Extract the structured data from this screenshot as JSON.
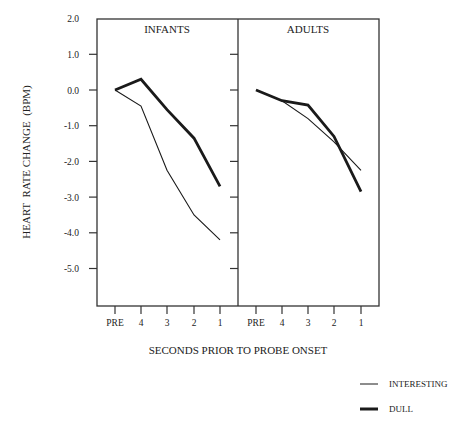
{
  "chart_data": [
    {
      "type": "line",
      "panel": "INFANTS",
      "title": "INFANTS",
      "categories": [
        "PRE",
        "4",
        "3",
        "2",
        "1"
      ],
      "series": [
        {
          "name": "INTERESTING",
          "values": [
            0.0,
            -0.45,
            -2.25,
            -3.5,
            -4.2
          ]
        },
        {
          "name": "DULL",
          "values": [
            0.0,
            0.3,
            -0.55,
            -1.35,
            -2.7
          ]
        }
      ],
      "xlabel": "SECONDS PRIOR TO PROBE ONSET",
      "ylabel": "HEART  RATE CHANGE  (BPM)",
      "ylim": [
        -6.0,
        2.0
      ],
      "yticks": [
        "2.0",
        "1.0",
        "0.0",
        "-1.0",
        "-2.0",
        "-3.0",
        "-4.0",
        "-5.0"
      ],
      "grid": false
    },
    {
      "type": "line",
      "panel": "ADULTS",
      "title": "ADULTS",
      "categories": [
        "PRE",
        "4",
        "3",
        "2",
        "1"
      ],
      "series": [
        {
          "name": "INTERESTING",
          "values": [
            0.0,
            -0.3,
            -0.8,
            -1.45,
            -2.25
          ]
        },
        {
          "name": "DULL",
          "values": [
            0.0,
            -0.3,
            -0.42,
            -1.3,
            -2.85
          ]
        }
      ],
      "xlabel": "SECONDS PRIOR TO PROBE ONSET",
      "ylabel": "HEART  RATE CHANGE  (BPM)",
      "ylim": [
        -6.0,
        2.0
      ],
      "grid": false
    }
  ],
  "labels": {
    "ylabel": "HEART  RATE CHANGE  (BPM)",
    "xlabel": "SECONDS PRIOR TO PROBE ONSET",
    "panel_infants": "INFANTS",
    "panel_adults": "ADULTS",
    "yticks": [
      "2.0",
      "1.0",
      "0.0",
      "-1.0",
      "-2.0",
      "-3.0",
      "-4.0",
      "-5.0"
    ],
    "xticks": [
      "PRE",
      "4",
      "3",
      "2",
      "1"
    ]
  },
  "legend": {
    "position": "bottom-right",
    "items": [
      {
        "name": "INTERESTING",
        "style": "thin"
      },
      {
        "name": "DULL",
        "style": "thick"
      }
    ]
  },
  "colors": {
    "line": "#1a1a1a",
    "axis": "#333333"
  }
}
